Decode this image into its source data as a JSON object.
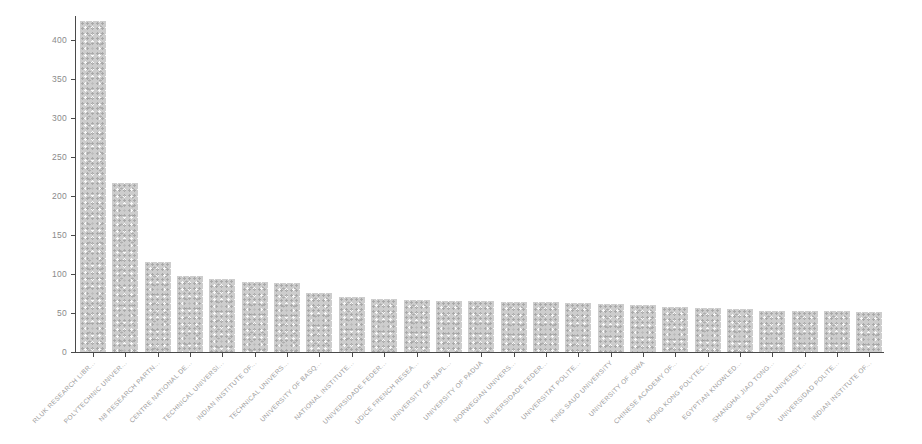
{
  "chart_data": {
    "type": "bar",
    "title": "",
    "xlabel": "",
    "ylabel": "",
    "grid": false,
    "legend": null,
    "ylim": [
      0,
      430
    ],
    "yticks": [
      0,
      50,
      100,
      150,
      200,
      250,
      300,
      350,
      400
    ],
    "categories": [
      "RLUK RESEARCH LIBR...",
      "POLYTECHNIC UNIVER...",
      "N8 RESEARCH PARTN...",
      "CENTRE NATIONAL DE...",
      "TECHNICAL UNIVERSI...",
      "INDIAN INSTITUTE OF...",
      "TECHNICAL UNIVERS...",
      "UNIVERSITY OF BASQ...",
      "NATIONAL INSTITUTE...",
      "UNIVERSIDADE FEDER...",
      "UDICE FRENCH RESEA...",
      "UNIVERSITY OF NAPL...",
      "UNIVERSITY OF PADUA",
      "NORWEGIAN UNIVERS...",
      "UNIVERSIDADE FEDER...",
      "UNIVERSITAT POLITE...",
      "KING SAUD UNIVERSITY",
      "UNIVERSITY OF IOWA",
      "CHINESE ACADEMY OF...",
      "HONG KONG POLYTEC...",
      "EGYPTIAN KNOWLED...",
      "SHANGHAI JIAO TONG...",
      "SALESIAN UNIVERSIT...",
      "UNIVERSIDAD POLITE...",
      "INDIAN INSTITUTE OF..."
    ],
    "values": [
      424,
      217,
      116,
      98,
      93,
      90,
      88,
      76,
      71,
      68,
      67,
      66,
      65,
      64,
      64,
      63,
      62,
      60,
      58,
      57,
      55,
      53,
      52,
      53,
      51
    ],
    "colors": {
      "bar_fill": "#cdcdcd",
      "axis": "#4a4a4a",
      "y_tick_label": "#8a8a8a",
      "x_tick_label": "#9c9c9c",
      "background": "#ffffff"
    }
  }
}
